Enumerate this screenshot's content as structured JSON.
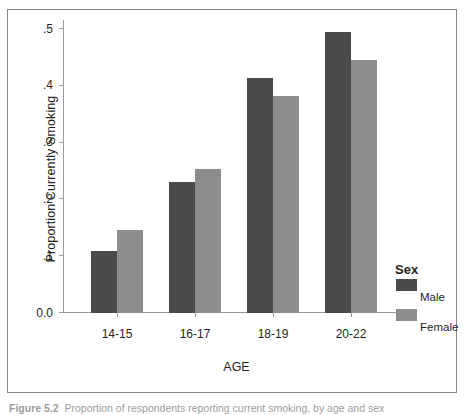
{
  "figure": {
    "frame_color": "#8a8a8a",
    "background": "#ffffff"
  },
  "legend": {
    "title": "Sex",
    "entries": [
      {
        "label": "Male",
        "color": "#4a4a4a",
        "swatch_name": "legend-swatch-male"
      },
      {
        "label": "Female",
        "color": "#8d8d8d",
        "swatch_name": "legend-swatch-female"
      }
    ]
  },
  "caption": {
    "figure_number": "Figure 5.2",
    "text": "Proportion of respondents reporting current smoking, by age and sex"
  },
  "chart_data": {
    "type": "bar",
    "title": "",
    "xlabel": "AGE",
    "ylabel": "Proportion Currently Smoking",
    "categories": [
      "14-15",
      "16-17",
      "18-19",
      "20-22"
    ],
    "ytick_labels": [
      "0.0",
      ".1",
      ".2",
      ".3",
      ".4",
      ".5"
    ],
    "ytick_values": [
      0.0,
      0.1,
      0.2,
      0.3,
      0.4,
      0.5
    ],
    "ylim": [
      0.0,
      0.5
    ],
    "grid": false,
    "legend_position": "right",
    "series": [
      {
        "name": "Male",
        "color": "#4a4a4a",
        "values": [
          0.11,
          0.23,
          0.414,
          0.494
        ]
      },
      {
        "name": "Female",
        "color": "#8d8d8d",
        "values": [
          0.147,
          0.253,
          0.382,
          0.445
        ]
      }
    ]
  }
}
